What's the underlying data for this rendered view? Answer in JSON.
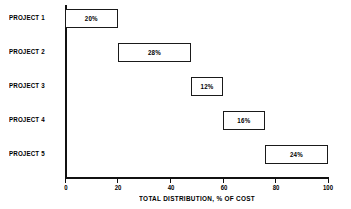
{
  "chart_data": {
    "type": "bar",
    "orientation": "horizontal",
    "subtype": "cascading-waterfall",
    "title": "",
    "xlabel": "TOTAL DISTRIBUTION, % OF COST",
    "ylabel": "",
    "xlim": [
      0,
      100
    ],
    "grid": false,
    "legend": null,
    "xticks": [
      0,
      20,
      40,
      60,
      80,
      100
    ],
    "xtick_labels": [
      "0",
      "20",
      "40",
      "60",
      "80",
      "100"
    ],
    "categories": [
      "PROJECT 1",
      "PROJECT 2",
      "PROJECT 3",
      "PROJECT 4",
      "PROJECT 5"
    ],
    "values": [
      20,
      28,
      12,
      16,
      24
    ],
    "value_labels": [
      "20%",
      "28%",
      "12%",
      "16%",
      "24%"
    ],
    "starts": [
      0,
      20,
      48,
      60,
      76
    ],
    "ends": [
      20,
      48,
      60,
      76,
      100
    ],
    "bars": [
      {
        "category": "PROJECT 1",
        "label": "20%",
        "value": 20,
        "start": 0,
        "end": 20
      },
      {
        "category": "PROJECT 2",
        "label": "28%",
        "value": 28,
        "start": 20,
        "end": 48
      },
      {
        "category": "PROJECT 3",
        "label": "12%",
        "value": 12,
        "start": 48,
        "end": 60
      },
      {
        "category": "PROJECT 4",
        "label": "16%",
        "value": 16,
        "start": 60,
        "end": 76
      },
      {
        "category": "PROJECT 5",
        "label": "24%",
        "value": 24,
        "start": 76,
        "end": 100
      }
    ],
    "total": 100,
    "colors": {
      "bar_fill": "#ffffff",
      "bar_stroke": "#1a1a1a",
      "axis": "#111111",
      "text": "#000000",
      "background": "#ffffff"
    }
  }
}
